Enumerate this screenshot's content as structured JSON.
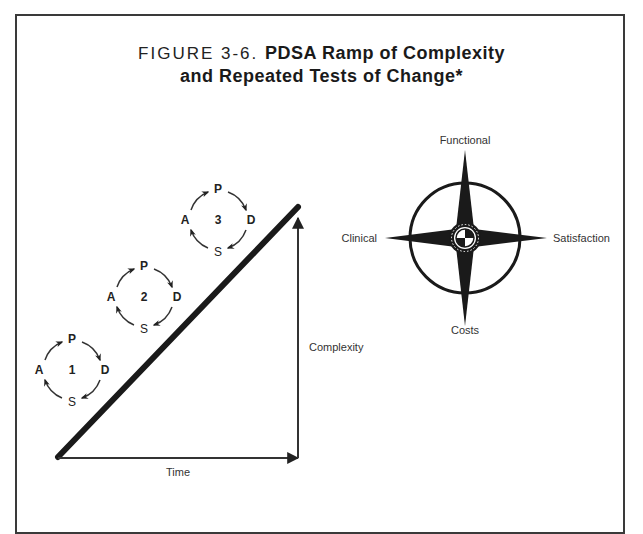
{
  "figure": {
    "prefix": "FIGURE 3-6.",
    "title_line1": "PDSA Ramp of Complexity",
    "title_line2": "and Repeated Tests of Change*"
  },
  "ramp": {
    "x_axis_label": "Time",
    "y_axis_label": "Complexity",
    "cycles": [
      {
        "number": "1",
        "p": "P",
        "d": "D",
        "s": "S",
        "a": "A"
      },
      {
        "number": "2",
        "p": "P",
        "d": "D",
        "s": "S",
        "a": "A"
      },
      {
        "number": "3",
        "p": "P",
        "d": "D",
        "s": "S",
        "a": "A"
      }
    ]
  },
  "compass": {
    "north": "Functional",
    "south": "Costs",
    "west": "Clinical",
    "east": "Satisfaction"
  },
  "colors": {
    "ink": "#1a1a1a",
    "border": "#3a3a3a",
    "background": "#ffffff"
  }
}
